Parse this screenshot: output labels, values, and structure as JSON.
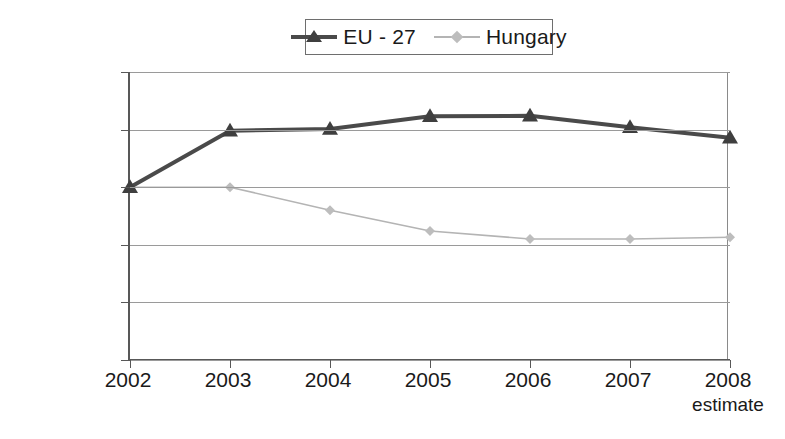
{
  "chart_data": {
    "type": "line",
    "title": "",
    "xlabel": "",
    "ylabel": "",
    "categories": [
      "2002",
      "2003",
      "2004",
      "2005",
      "2006",
      "2007",
      "2008"
    ],
    "x_sub_labels": [
      "",
      "",
      "",
      "",
      "",
      "",
      "estimate"
    ],
    "ylim": [
      70,
      120
    ],
    "y_ticks": [
      70,
      80,
      90,
      100,
      110,
      120
    ],
    "y_tick_labels": [
      "70.00%",
      "80.00%",
      "90.00%",
      "100.00%",
      "110.00%",
      "120.00%"
    ],
    "grid": true,
    "legend_position": "top-center",
    "series": [
      {
        "name": "EU - 27",
        "color": "#4a4a4a",
        "marker": "triangle",
        "values": [
          100.0,
          109.8,
          110.1,
          112.3,
          112.4,
          110.4,
          108.6
        ]
      },
      {
        "name": "Hungary",
        "color": "#b4b4b4",
        "marker": "diamond",
        "values": [
          100.0,
          100.0,
          96.0,
          92.4,
          91.0,
          91.0,
          91.3
        ]
      }
    ]
  },
  "legend": {
    "entries": [
      {
        "label": "EU - 27"
      },
      {
        "label": "Hungary"
      }
    ]
  },
  "caption": {
    "text": ""
  }
}
